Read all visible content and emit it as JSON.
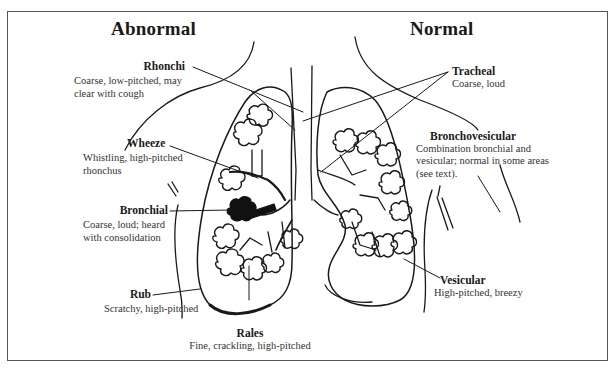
{
  "headings": {
    "abnormal": "Abnormal",
    "normal": "Normal"
  },
  "labels": {
    "rhonchi": {
      "title": "Rhonchi",
      "desc_line1": "Coarse, low-pitched, may",
      "desc_line2": "clear with cough"
    },
    "wheeze": {
      "title": "Wheeze",
      "desc_line1": "Whistling, high-pitched",
      "desc_line2": "rhonchus"
    },
    "bronchial": {
      "title": "Bronchial",
      "desc_line1": "Coarse, loud; heard",
      "desc_line2": "with consolidation"
    },
    "rub": {
      "title": "Rub",
      "desc_line1": "Scratchy, high-pitched"
    },
    "rales": {
      "title": "Rales",
      "desc_line1": "Fine, crackling, high-pitched"
    },
    "tracheal": {
      "title": "Tracheal",
      "desc_line1": "Coarse, loud"
    },
    "bronchovesicular": {
      "title": "Bronchovesicular",
      "desc_line1": "Combination bronchial and",
      "desc_line2": "vesicular; normal in some areas",
      "desc_line3": "(see text)."
    },
    "vesicular": {
      "title": "Vesicular",
      "desc_line1": "High-pitched, breezy"
    }
  },
  "colors": {
    "ink": "#1a1a1a",
    "frame": "#555555",
    "background": "#ffffff"
  }
}
